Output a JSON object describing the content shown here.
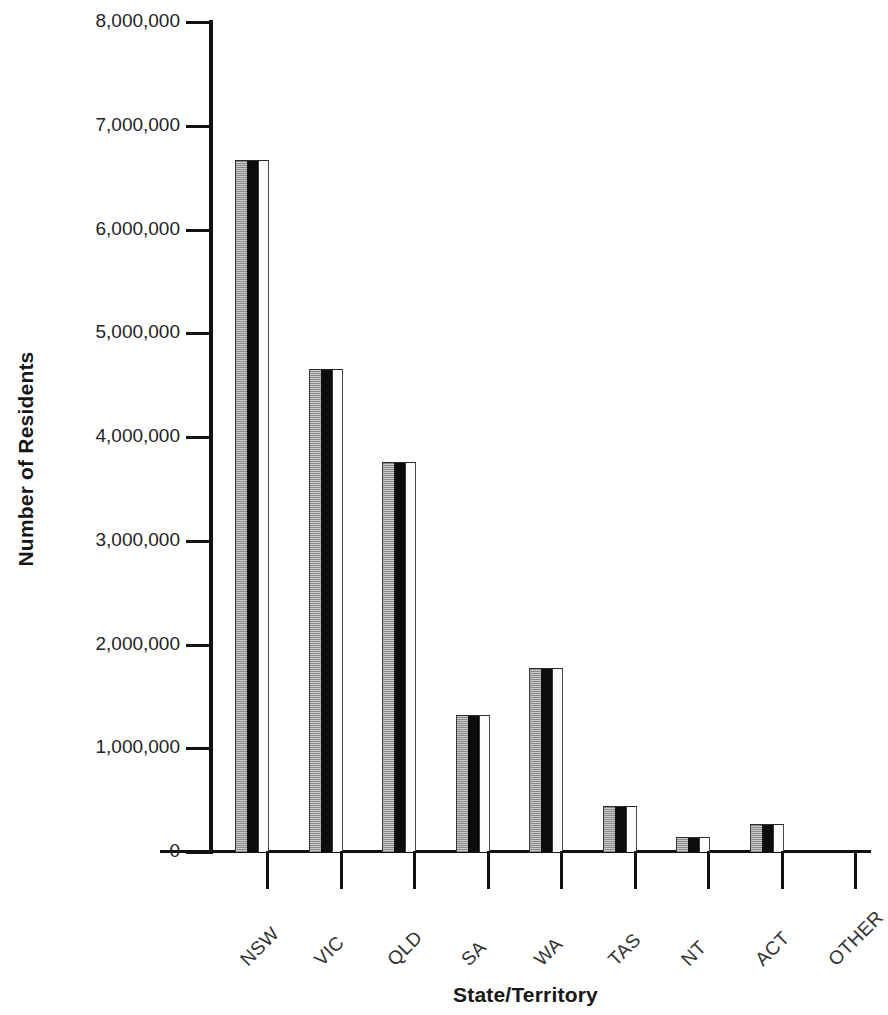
{
  "chart_data": {
    "type": "bar",
    "title": "",
    "xlabel": "State/Territory",
    "ylabel": "Number of Residents",
    "categories": [
      "NSW",
      "VIC",
      "QLD",
      "SA",
      "WA",
      "TAS",
      "NT",
      "ACT",
      "OTHER"
    ],
    "values": [
      6670000,
      4660000,
      3760000,
      1320000,
      1770000,
      440000,
      140000,
      270000,
      0
    ],
    "ylim": [
      0,
      8000000
    ],
    "ytick_labels": [
      "8,000,000",
      "7,000,000",
      "6,000,000",
      "5,000,000",
      "4,000,000",
      "3,000,000",
      "2,000,000",
      "1,000,000",
      "0"
    ],
    "ytick_values": [
      8000000,
      7000000,
      6000000,
      5000000,
      4000000,
      3000000,
      2000000,
      1000000,
      0
    ],
    "grid": false,
    "legend": false,
    "legend_position": "none",
    "bar_style": "3d-shaded",
    "colors": {
      "bar_face": "#0d0d0d",
      "bar_side": "#a9a9a9",
      "bar_highlight": "#fdfdfd",
      "axis": "#111111",
      "text": "#1a1a1a"
    }
  },
  "axes": {
    "y_title": "Number of Residents",
    "x_title": "State/Territory"
  }
}
